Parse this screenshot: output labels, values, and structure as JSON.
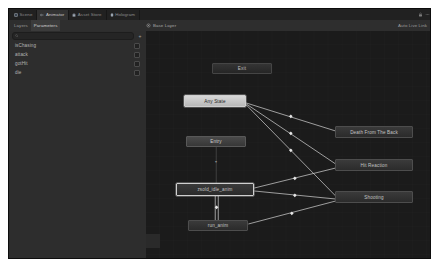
{
  "window": {
    "background": "#191919",
    "panel_bg": "#2d2d2d",
    "canvas_bg": "#1b1b1b"
  },
  "tabs": [
    {
      "label": "Scene",
      "icon": "scene-icon",
      "active": false
    },
    {
      "label": "Animator",
      "icon": "animator-icon",
      "active": true
    },
    {
      "label": "Asset Store",
      "icon": "asset-store-icon",
      "active": false
    },
    {
      "label": "Hologram",
      "icon": "hologram-icon",
      "active": false
    }
  ],
  "tabstrip_right": {
    "icons": [
      "lock-icon",
      "menu-icon"
    ]
  },
  "toolbar": {
    "subtabs": [
      {
        "label": "Layers",
        "active": false
      },
      {
        "label": "Parameters",
        "active": true
      }
    ],
    "breadcrumb": {
      "icon": "layer-icon",
      "label": "Base Layer",
      "sub_icon": "layer-sub-icon",
      "chevron": "chevron-down-icon"
    },
    "auto_live_link": {
      "label": "Auto Live Link",
      "icon": "live-link-icon"
    }
  },
  "search": {
    "icon": "search-icon",
    "value": "",
    "placeholder": "",
    "add_label": "+",
    "add_icon": "plus-icon"
  },
  "parameters": [
    {
      "name": "isChasing",
      "type": "bool"
    },
    {
      "name": "attack",
      "type": "bool"
    },
    {
      "name": "gotHit",
      "type": "bool"
    },
    {
      "name": "die",
      "type": "bool"
    }
  ],
  "graph": {
    "nodes": [
      {
        "id": "exit",
        "label": "Exit",
        "kind": "exit",
        "x": 66,
        "y": 32,
        "w": 60,
        "h": 11,
        "selected": false
      },
      {
        "id": "anystate",
        "label": "Any State",
        "kind": "any",
        "x": 38,
        "y": 64,
        "w": 62,
        "h": 12,
        "selected": true
      },
      {
        "id": "entry",
        "label": "Entry",
        "kind": "entry",
        "x": 40,
        "y": 105,
        "w": 60,
        "h": 11,
        "selected": false
      },
      {
        "id": "idle",
        "label": "zsold_idle_anim",
        "kind": "dark",
        "x": 30,
        "y": 152,
        "w": 78,
        "h": 13,
        "selected": true
      },
      {
        "id": "run",
        "label": "run_anim",
        "kind": "dark",
        "x": 42,
        "y": 189,
        "w": 60,
        "h": 11,
        "selected": false
      },
      {
        "id": "death",
        "label": "Death From The Back",
        "kind": "dark",
        "x": 189,
        "y": 95,
        "w": 78,
        "h": 12,
        "selected": false
      },
      {
        "id": "hit",
        "label": "Hit Reaction",
        "kind": "dark",
        "x": 189,
        "y": 128,
        "w": 78,
        "h": 12,
        "selected": false
      },
      {
        "id": "shoot",
        "label": "Shooting",
        "kind": "dark",
        "x": 189,
        "y": 160,
        "w": 78,
        "h": 12,
        "selected": false
      }
    ],
    "transitions": [
      {
        "from": "anystate",
        "to": "death",
        "arrow_marker": true
      },
      {
        "from": "anystate",
        "to": "hit",
        "arrow_marker": true
      },
      {
        "from": "anystate",
        "to": "shoot",
        "arrow_marker": true
      },
      {
        "from": "idle",
        "to": "hit",
        "arrow_marker": true
      },
      {
        "from": "idle",
        "to": "shoot",
        "arrow_marker": true
      },
      {
        "from": "idle",
        "to": "run",
        "arrow_marker": true
      },
      {
        "from": "run",
        "to": "idle",
        "arrow_marker": true
      },
      {
        "from": "run",
        "to": "shoot",
        "arrow_marker": true
      },
      {
        "from": "entry",
        "to": "idle",
        "arrow_marker": false
      }
    ],
    "edge_color": "#d6d6d6"
  }
}
